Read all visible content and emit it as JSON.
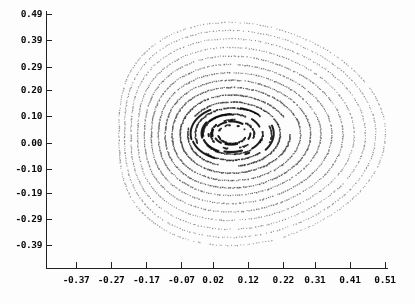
{
  "figure": {
    "title": "",
    "background_color": "#fdfdfd",
    "ink_color": "#111111"
  },
  "chart_data": {
    "type": "scatter",
    "title": "",
    "subtitle": "",
    "xlabel": "",
    "ylabel": "",
    "grid": false,
    "legend": null,
    "legend_position": "none",
    "xlim": [
      -0.42,
      0.51
    ],
    "ylim": [
      -0.44,
      0.49
    ],
    "xticks": [
      -0.37,
      -0.27,
      -0.17,
      -0.07,
      0.02,
      0.12,
      0.22,
      0.31,
      0.41,
      0.51
    ],
    "xticklabels": [
      "-0.37",
      "-0.27",
      "-0.17",
      "-0.07",
      "0.02",
      "0.12",
      "0.22",
      "0.31",
      "0.41",
      "0.51"
    ],
    "yticks": [
      0.49,
      0.39,
      0.29,
      0.2,
      0.1,
      0.0,
      -0.1,
      -0.19,
      -0.29,
      -0.39
    ],
    "yticklabels": [
      "0.49",
      "0.39",
      "0.29",
      "0.20",
      "0.10",
      "0.00",
      "-0.10",
      "-0.19",
      "-0.29",
      "-0.39"
    ],
    "center": [
      0.072,
      0.035
    ],
    "series": [
      {
        "name": "torus-1",
        "radius": 0.04,
        "points": 70,
        "dot": 1.7,
        "gray": 0.06,
        "gaps": 6,
        "gap_frac": 0.46,
        "squash": 0.88,
        "tri": 0.02,
        "tilt": -0.1
      },
      {
        "name": "torus-2",
        "radius": 0.062,
        "points": 90,
        "dot": 1.7,
        "gray": 0.08,
        "gaps": 5,
        "gap_frac": 0.42,
        "squash": 0.88,
        "tri": 0.03,
        "tilt": -0.09
      },
      {
        "name": "torus-3",
        "radius": 0.086,
        "points": 120,
        "dot": 1.6,
        "gray": 0.1,
        "gaps": 4,
        "gap_frac": 0.34,
        "squash": 0.88,
        "tri": 0.04,
        "tilt": -0.08
      },
      {
        "name": "torus-4",
        "radius": 0.11,
        "points": 150,
        "dot": 1.5,
        "gray": 0.14,
        "gaps": 3,
        "gap_frac": 0.22,
        "squash": 0.89,
        "tri": 0.05,
        "tilt": -0.07
      },
      {
        "name": "torus-5",
        "radius": 0.134,
        "points": 180,
        "dot": 1.4,
        "gray": 0.2,
        "gaps": 2,
        "gap_frac": 0.14,
        "squash": 0.9,
        "tri": 0.06,
        "tilt": -0.06
      },
      {
        "name": "torus-6",
        "radius": 0.16,
        "points": 200,
        "dot": 1.4,
        "gray": 0.26,
        "gaps": 1,
        "gap_frac": 0.08,
        "squash": 0.91,
        "tri": 0.075,
        "tilt": -0.05
      },
      {
        "name": "torus-7",
        "radius": 0.188,
        "points": 215,
        "dot": 1.3,
        "gray": 0.32,
        "gaps": 0,
        "gap_frac": 0.0,
        "squash": 0.92,
        "tri": 0.09,
        "tilt": -0.04
      },
      {
        "name": "torus-8",
        "radius": 0.214,
        "points": 230,
        "dot": 1.3,
        "gray": 0.36,
        "gaps": 0,
        "gap_frac": 0.0,
        "squash": 0.93,
        "tri": 0.105,
        "tilt": -0.03
      },
      {
        "name": "torus-9",
        "radius": 0.24,
        "points": 245,
        "dot": 1.2,
        "gray": 0.4,
        "gaps": 0,
        "gap_frac": 0.0,
        "squash": 0.94,
        "tri": 0.12,
        "tilt": -0.02
      },
      {
        "name": "torus-10",
        "radius": 0.268,
        "points": 255,
        "dot": 1.2,
        "gray": 0.44,
        "gaps": 0,
        "gap_frac": 0.0,
        "squash": 0.95,
        "tri": 0.135,
        "tilt": -0.02
      },
      {
        "name": "torus-11",
        "radius": 0.296,
        "points": 265,
        "dot": 1.2,
        "gray": 0.48,
        "gaps": 0,
        "gap_frac": 0.0,
        "squash": 0.96,
        "tri": 0.15,
        "tilt": -0.01
      },
      {
        "name": "torus-12",
        "radius": 0.324,
        "points": 275,
        "dot": 1.1,
        "gray": 0.52,
        "gaps": 0,
        "gap_frac": 0.0,
        "squash": 0.97,
        "tri": 0.162,
        "tilt": -0.01
      },
      {
        "name": "torus-13",
        "radius": 0.352,
        "points": 285,
        "dot": 1.1,
        "gray": 0.55,
        "gaps": 0,
        "gap_frac": 0.0,
        "squash": 0.98,
        "tri": 0.172,
        "tilt": 0.0
      },
      {
        "name": "torus-14",
        "radius": 0.378,
        "points": 295,
        "dot": 1.1,
        "gray": 0.58,
        "gaps": 0,
        "gap_frac": 0.0,
        "squash": 0.99,
        "tri": 0.18,
        "tilt": 0.0
      },
      {
        "name": "torus-15",
        "radius": 0.402,
        "points": 300,
        "dot": 1.1,
        "gray": 0.6,
        "gaps": 0,
        "gap_frac": 0.0,
        "squash": 1.0,
        "tri": 0.188,
        "tilt": 0.0
      }
    ],
    "island_arcs": [
      {
        "name": "arc-inner-top",
        "radius": 0.052,
        "start_deg": 58,
        "span_deg": 44,
        "width": 2.2
      },
      {
        "name": "arc-inner-upper-left",
        "radius": 0.05,
        "start_deg": 112,
        "span_deg": 34,
        "width": 2.0
      },
      {
        "name": "arc-inner-left",
        "radius": 0.055,
        "start_deg": 168,
        "span_deg": 30,
        "width": 2.0
      },
      {
        "name": "arc-inner-lower-left",
        "radius": 0.05,
        "start_deg": 212,
        "span_deg": 28,
        "width": 2.0
      },
      {
        "name": "arc-inner-bottom",
        "radius": 0.048,
        "start_deg": 256,
        "span_deg": 40,
        "width": 2.2
      },
      {
        "name": "arc-inner-right",
        "radius": 0.054,
        "start_deg": 340,
        "span_deg": 26,
        "width": 2.0
      },
      {
        "name": "arc-mid-top-left",
        "radius": 0.082,
        "start_deg": 96,
        "span_deg": 50,
        "width": 2.2
      },
      {
        "name": "arc-mid-left",
        "radius": 0.086,
        "start_deg": 152,
        "span_deg": 46,
        "width": 2.2
      },
      {
        "name": "arc-mid-bottom-left",
        "radius": 0.084,
        "start_deg": 206,
        "span_deg": 44,
        "width": 2.2
      },
      {
        "name": "arc-mid-bottom",
        "radius": 0.08,
        "start_deg": 262,
        "span_deg": 36,
        "width": 2.2
      },
      {
        "name": "arc-mid-right",
        "radius": 0.088,
        "start_deg": 318,
        "span_deg": 30,
        "width": 2.0
      },
      {
        "name": "arc-mid-top-right",
        "radius": 0.085,
        "start_deg": 26,
        "span_deg": 26,
        "width": 2.0
      },
      {
        "name": "arc-outerc-left",
        "radius": 0.118,
        "start_deg": 126,
        "span_deg": 72,
        "width": 2.0
      },
      {
        "name": "arc-outerc-bot-left",
        "radius": 0.116,
        "start_deg": 204,
        "span_deg": 48,
        "width": 2.0
      },
      {
        "name": "arc-outerc-right",
        "radius": 0.12,
        "start_deg": 330,
        "span_deg": 52,
        "width": 2.0
      },
      {
        "name": "arc-outerc-top",
        "radius": 0.112,
        "start_deg": 52,
        "span_deg": 30,
        "width": 1.8
      },
      {
        "name": "arc-tick-right",
        "radius": 0.098,
        "start_deg": 300,
        "span_deg": 7,
        "width": 2.0
      },
      {
        "name": "arc-tick-left",
        "radius": 0.066,
        "start_deg": 188,
        "span_deg": 8,
        "width": 2.0
      }
    ]
  },
  "axes": {
    "name": "plot-axes",
    "frame_left_px": 46,
    "frame_top_px": 11,
    "frame_bottom_px": 268,
    "frame_right_px": 388,
    "tick_length_px": 6,
    "line_color": "#222222"
  }
}
